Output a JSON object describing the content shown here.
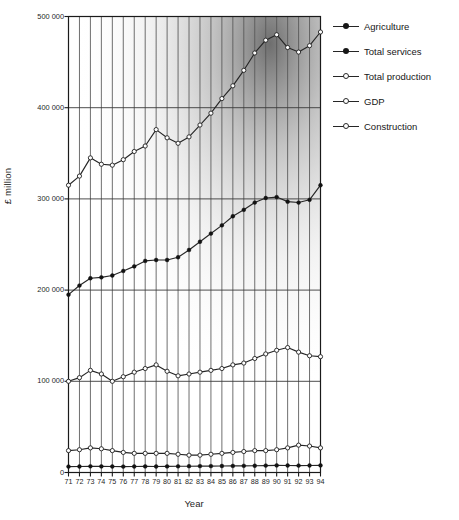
{
  "chart_data": {
    "type": "line",
    "title": "",
    "xlabel": "Year",
    "ylabel": "£ million",
    "x": [
      71,
      72,
      73,
      74,
      75,
      76,
      77,
      78,
      79,
      80,
      81,
      82,
      83,
      84,
      85,
      86,
      87,
      88,
      89,
      90,
      91,
      92,
      93,
      94
    ],
    "categories": [
      "71",
      "72",
      "73",
      "74",
      "75",
      "76",
      "77",
      "78",
      "79",
      "80",
      "81",
      "82",
      "83",
      "84",
      "85",
      "86",
      "87",
      "88",
      "89",
      "90",
      "91",
      "92",
      "93",
      "94"
    ],
    "xlim": [
      71,
      94
    ],
    "ylim": [
      0,
      500000
    ],
    "yticks": [
      0,
      100000,
      200000,
      300000,
      400000,
      500000
    ],
    "ytick_labels": [
      "0",
      "100 000",
      "200 000",
      "300 000",
      "400 000",
      "500 000"
    ],
    "grid": "vertical-gridlines-at-each-year-plus-horizontal-at-each-ytick",
    "legend_position": "right",
    "series": [
      {
        "name": "GDP",
        "marker": "open-circle",
        "values": [
          315000,
          325000,
          345000,
          338000,
          337000,
          343000,
          352000,
          358000,
          376000,
          367000,
          361000,
          368000,
          381000,
          394000,
          410000,
          424000,
          441000,
          460000,
          474000,
          480000,
          466000,
          461000,
          468000,
          483000
        ]
      },
      {
        "name": "Total services",
        "marker": "filled-circle",
        "values": [
          195000,
          205000,
          213000,
          214000,
          216000,
          221000,
          226000,
          232000,
          233000,
          233000,
          236000,
          244000,
          253000,
          262000,
          271000,
          281000,
          288000,
          296000,
          301000,
          302000,
          297000,
          296000,
          299000,
          315000
        ]
      },
      {
        "name": "Total production",
        "marker": "open-circle",
        "values": [
          100000,
          104000,
          112000,
          108000,
          100000,
          105000,
          110000,
          114000,
          118000,
          111000,
          106000,
          108000,
          110000,
          112000,
          114000,
          118000,
          120000,
          125000,
          130000,
          134000,
          137000,
          132000,
          128000,
          127000
        ]
      },
      {
        "name": "Construction",
        "marker": "open-circle",
        "values": [
          24000,
          25000,
          27000,
          26000,
          24000,
          22000,
          21000,
          21000,
          21000,
          21000,
          20000,
          19000,
          19000,
          20000,
          21000,
          22000,
          23000,
          24000,
          24000,
          25000,
          27000,
          30000,
          29000,
          27000
        ]
      },
      {
        "name": "Agriculture",
        "marker": "filled-circle",
        "values": [
          6500,
          6600,
          6800,
          6700,
          6600,
          6500,
          6600,
          6700,
          6600,
          6700,
          6800,
          6900,
          7000,
          7000,
          7100,
          7200,
          7300,
          7400,
          7600,
          7800,
          7700,
          7600,
          7700,
          7800
        ]
      }
    ]
  },
  "legend": {
    "items": [
      {
        "label": "Agriculture",
        "marker": "filled-circle",
        "series": "Agriculture"
      },
      {
        "label": "Total services",
        "marker": "filled-circle",
        "series": "Total services"
      },
      {
        "label": "Total production",
        "marker": "open-circle",
        "series": "Total production"
      },
      {
        "label": "GDP",
        "marker": "open-circle",
        "series": "GDP"
      },
      {
        "label": "Construction",
        "marker": "open-circle",
        "series": "Construction"
      }
    ]
  },
  "colors": {
    "line": "#262626",
    "frame": "#1a1a1a",
    "gridline": "#555555",
    "background": "#ffffff"
  }
}
